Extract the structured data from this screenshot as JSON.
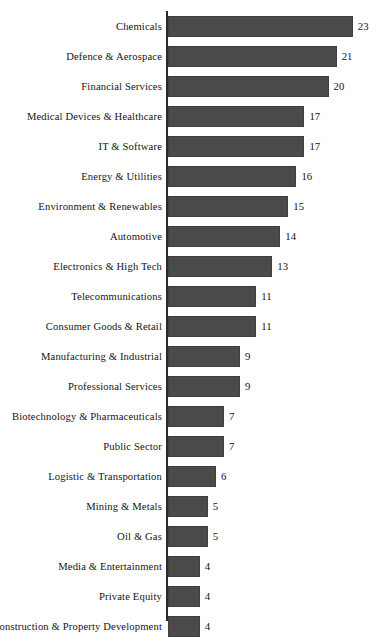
{
  "chart_data": {
    "type": "bar",
    "orientation": "horizontal",
    "title": "",
    "subtitle": "",
    "xlabel": "",
    "ylabel": "",
    "grid": false,
    "legend": null,
    "xlim": [
      0,
      23
    ],
    "axis": {
      "category_axis": "vertical-left",
      "value_axis_visible": false,
      "tick_labels": []
    },
    "value_labels_shown": true,
    "bar_color": "#4a4a4a",
    "background_color": "#ffffff",
    "text_color": "#141414",
    "categories": [
      "Chemicals",
      "Defence & Aerospace",
      "Financial Services",
      "Medical Devices & Healthcare",
      "IT & Software",
      "Energy & Utilities",
      "Environment & Renewables",
      "Automotive",
      "Electronics & High Tech",
      "Telecommunications",
      "Consumer Goods & Retail",
      "Manufacturing & Industrial",
      "Professional Services",
      "Biotechnology & Pharmaceuticals",
      "Public Sector",
      "Logistic & Transportation",
      "Mining & Metals",
      "Oil & Gas",
      "Media & Entertainment",
      "Private Equity",
      "Construction & Property Development"
    ],
    "values": [
      23,
      21,
      20,
      17,
      17,
      16,
      15,
      14,
      13,
      11,
      11,
      9,
      9,
      7,
      7,
      6,
      5,
      5,
      4,
      4,
      4
    ],
    "bars": [
      {
        "label": "Chemicals",
        "value": 23,
        "value_text": "23"
      },
      {
        "label": "Defence & Aerospace",
        "value": 21,
        "value_text": "21"
      },
      {
        "label": "Financial Services",
        "value": 20,
        "value_text": "20"
      },
      {
        "label": "Medical Devices & Healthcare",
        "value": 17,
        "value_text": "17"
      },
      {
        "label": "IT & Software",
        "value": 17,
        "value_text": "17"
      },
      {
        "label": "Energy & Utilities",
        "value": 16,
        "value_text": "16"
      },
      {
        "label": "Environment & Renewables",
        "value": 15,
        "value_text": "15"
      },
      {
        "label": "Automotive",
        "value": 14,
        "value_text": "14"
      },
      {
        "label": "Electronics & High Tech",
        "value": 13,
        "value_text": "13"
      },
      {
        "label": "Telecommunications",
        "value": 11,
        "value_text": "11"
      },
      {
        "label": "Consumer Goods & Retail",
        "value": 11,
        "value_text": "11"
      },
      {
        "label": "Manufacturing & Industrial",
        "value": 9,
        "value_text": "9"
      },
      {
        "label": "Professional Services",
        "value": 9,
        "value_text": "9"
      },
      {
        "label": "Biotechnology & Pharmaceuticals",
        "value": 7,
        "value_text": "7"
      },
      {
        "label": "Public Sector",
        "value": 7,
        "value_text": "7"
      },
      {
        "label": "Logistic & Transportation",
        "value": 6,
        "value_text": "6"
      },
      {
        "label": "Mining & Metals",
        "value": 5,
        "value_text": "5"
      },
      {
        "label": "Oil & Gas",
        "value": 5,
        "value_text": "5"
      },
      {
        "label": "Media & Entertainment",
        "value": 4,
        "value_text": "4"
      },
      {
        "label": "Private Equity",
        "value": 4,
        "value_text": "4"
      },
      {
        "label": "Construction & Property Development",
        "value": 4,
        "value_text": "4"
      }
    ]
  }
}
